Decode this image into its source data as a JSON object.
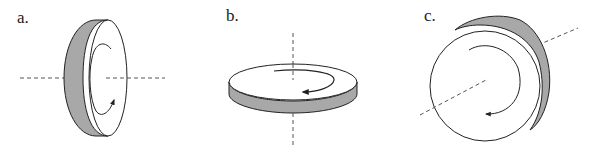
{
  "panels": [
    {
      "label": "a.",
      "description": "Disk rotating about horizontal axis, viewed edge-on tilted"
    },
    {
      "label": "b.",
      "description": "Flat disk rotating about vertical axis"
    },
    {
      "label": "c.",
      "description": "Disk face-on rotating about diagonal axis"
    }
  ],
  "colors": {
    "rim": "#a8a8a8",
    "stroke": "#222222",
    "axis": "#555555"
  }
}
